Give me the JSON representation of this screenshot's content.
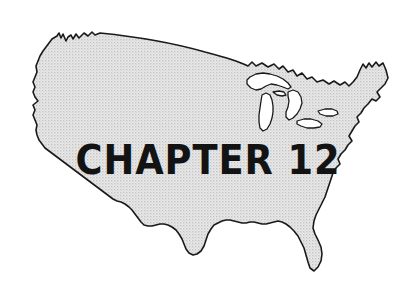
{
  "page": {
    "background_color": "#ffffff",
    "width": 417,
    "height": 292
  },
  "figure": {
    "name": "united-states-map",
    "fill_color": "#d8d8d8",
    "outline_color": "#1a1a1a",
    "lake_fill_color": "#ffffff",
    "fill_style": "halftone-dither"
  },
  "title": {
    "text": "CHAPTER 12",
    "color": "#131313",
    "word": "CHAPTER",
    "number": "12"
  }
}
